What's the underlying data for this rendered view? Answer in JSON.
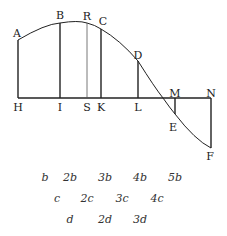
{
  "diagram": {
    "colors": {
      "line": "#222222",
      "thin_line": "#555555",
      "text": "#222222"
    },
    "baseline": {
      "y": 98,
      "x1": 18,
      "x2": 211
    },
    "curve_path": "M18,40 Q45,24 60,23 Q78,20 87,23 Q95,25 101,29 Q120,40 138,61 Q155,88 163,98 Q170,108 175,114 Q195,140 211,148",
    "verticals": [
      {
        "name": "AH",
        "x": 18,
        "y_top": 40,
        "y_bot": 98,
        "thin": false
      },
      {
        "name": "BI",
        "x": 60,
        "y_top": 23,
        "y_bot": 98,
        "thin": false
      },
      {
        "name": "RS",
        "x": 87,
        "y_top": 23,
        "y_bot": 98,
        "thin": true
      },
      {
        "name": "CK",
        "x": 101,
        "y_top": 29,
        "y_bot": 98,
        "thin": false
      },
      {
        "name": "DL",
        "x": 138,
        "y_top": 61,
        "y_bot": 98,
        "thin": false
      },
      {
        "name": "ME",
        "x": 175,
        "y_top": 98,
        "y_bot": 114,
        "thin": false
      },
      {
        "name": "NF",
        "x": 211,
        "y_top": 98,
        "y_bot": 148,
        "thin": false
      }
    ],
    "point_labels": [
      {
        "text": "A",
        "x": 17,
        "y": 37
      },
      {
        "text": "B",
        "x": 60,
        "y": 19
      },
      {
        "text": "R",
        "x": 87,
        "y": 20
      },
      {
        "text": "C",
        "x": 103,
        "y": 25
      },
      {
        "text": "D",
        "x": 138,
        "y": 59
      },
      {
        "text": "H",
        "x": 18,
        "y": 111
      },
      {
        "text": "I",
        "x": 60,
        "y": 111
      },
      {
        "text": "S",
        "x": 87,
        "y": 111
      },
      {
        "text": "K",
        "x": 101,
        "y": 111
      },
      {
        "text": "L",
        "x": 138,
        "y": 111
      },
      {
        "text": "M",
        "x": 175,
        "y": 97
      },
      {
        "text": "N",
        "x": 211,
        "y": 97
      },
      {
        "text": "E",
        "x": 173,
        "y": 131
      },
      {
        "text": "F",
        "x": 210,
        "y": 160
      }
    ],
    "series_rows": [
      {
        "y": 181,
        "items": [
          {
            "text": "b",
            "x": 45
          },
          {
            "text": "2b",
            "x": 70
          },
          {
            "text": "3b",
            "x": 105
          },
          {
            "text": "4b",
            "x": 140
          },
          {
            "text": "5b",
            "x": 175
          }
        ]
      },
      {
        "y": 202,
        "items": [
          {
            "text": "c",
            "x": 57
          },
          {
            "text": "2c",
            "x": 87
          },
          {
            "text": "3c",
            "x": 122
          },
          {
            "text": "4c",
            "x": 157
          }
        ]
      },
      {
        "y": 223,
        "items": [
          {
            "text": "d",
            "x": 70
          },
          {
            "text": "2d",
            "x": 105
          },
          {
            "text": "3d",
            "x": 140
          }
        ]
      }
    ]
  }
}
